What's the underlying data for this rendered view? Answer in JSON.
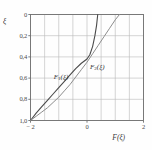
{
  "figure": {
    "background": "#fefefe",
    "frame_color": "#6f6f6f",
    "grid_color": "#b9b9b9"
  },
  "axes": {
    "y_label": "ξ",
    "x_label_F": "F",
    "x_label_arg": "(ξ)",
    "y_ticks": [
      "1,0",
      "0,8",
      "0,6",
      "0,4",
      "0,2",
      "0"
    ],
    "y_tick_values": [
      1.0,
      0.8,
      0.6,
      0.4,
      0.2,
      0.0
    ],
    "x_ticks": [
      "− 2",
      "0",
      "2"
    ],
    "x_tick_values": [
      -2,
      0,
      2
    ]
  },
  "annotations": {
    "curve1_F": "F",
    "curve1_sub": "1",
    "curve1_arg": "(ξ)",
    "curve2_F": "F",
    "curve2_sub": "2",
    "curve2_arg": "(ξ)"
  },
  "chart_data": {
    "type": "line",
    "title": "",
    "xlabel": "F(ξ)",
    "ylabel": "ξ",
    "xlim": [
      -2,
      2
    ],
    "ylim": [
      0,
      1.0
    ],
    "grid": true,
    "legend": "inline-labels",
    "x_ticks": [
      -2,
      0,
      2
    ],
    "y_ticks": [
      0,
      0.2,
      0.4,
      0.6,
      0.8,
      1.0
    ],
    "x_minor_step": 0.5,
    "y_minor_step": 0.2,
    "series": [
      {
        "name": "F1(ξ)",
        "color": "#4a4a4a",
        "width": 1.1,
        "label_x": -0.75,
        "label_y": 0.4,
        "points": [
          [
            -2.0,
            0.0
          ],
          [
            -1.8,
            0.07
          ],
          [
            -1.6,
            0.13
          ],
          [
            -1.4,
            0.19
          ],
          [
            -1.2,
            0.25
          ],
          [
            -1.0,
            0.31
          ],
          [
            -0.8,
            0.37
          ],
          [
            -0.6,
            0.43
          ],
          [
            -0.4,
            0.49
          ],
          [
            -0.2,
            0.54
          ],
          [
            0.0,
            0.58
          ],
          [
            0.1,
            0.62
          ],
          [
            0.2,
            0.7
          ],
          [
            0.28,
            0.8
          ],
          [
            0.34,
            0.9
          ],
          [
            0.38,
            1.0
          ]
        ]
      },
      {
        "name": "F2(ξ)",
        "color": "#8d8d8d",
        "width": 1.0,
        "label_x": 0.25,
        "label_y": 0.5,
        "points": [
          [
            -2.0,
            0.0
          ],
          [
            -1.8,
            0.04
          ],
          [
            -1.6,
            0.08
          ],
          [
            -1.4,
            0.12
          ],
          [
            -1.2,
            0.17
          ],
          [
            -1.0,
            0.22
          ],
          [
            -0.8,
            0.28
          ],
          [
            -0.6,
            0.34
          ],
          [
            -0.4,
            0.41
          ],
          [
            -0.2,
            0.48
          ],
          [
            0.0,
            0.55
          ],
          [
            0.2,
            0.63
          ],
          [
            0.4,
            0.71
          ],
          [
            0.6,
            0.79
          ],
          [
            0.8,
            0.87
          ],
          [
            1.0,
            0.95
          ],
          [
            1.15,
            1.0
          ]
        ]
      }
    ]
  }
}
